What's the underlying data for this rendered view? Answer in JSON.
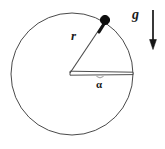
{
  "figure": {
    "background_color": "#ffffff",
    "stroke_color": "#3a3a3a",
    "bold_stroke_color": "#111111",
    "labels": {
      "radius": "r",
      "angle": "α",
      "gravity": "g"
    },
    "geometry": {
      "circle": {
        "center_x": 72,
        "center_y": 74,
        "radius": 61,
        "stroke_width": 1
      },
      "center_vertex": {
        "x": 70,
        "y": 73
      },
      "bob": {
        "x": 105,
        "y": 20,
        "radius": 4.5
      },
      "horizontal_radius_end": {
        "x": 133,
        "y": 73
      },
      "angle_arc_tick": {
        "x": 100,
        "y": 77
      },
      "gravity_arrow": {
        "x": 153,
        "y_start": 10,
        "y_end": 48,
        "head_width": 7,
        "head_length": 9
      }
    }
  }
}
